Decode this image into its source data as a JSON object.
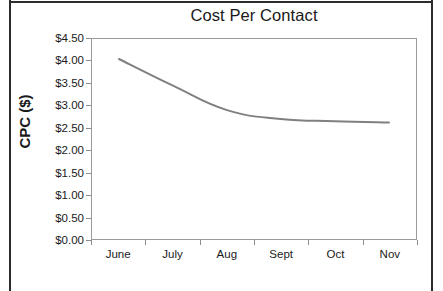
{
  "chart_data": {
    "type": "line",
    "title": "Cost Per Contact",
    "xlabel": "",
    "ylabel": "CPC ($)",
    "categories": [
      "June",
      "July",
      "Aug",
      "Sept",
      "Oct",
      "Nov"
    ],
    "series": [
      {
        "name": "CPC",
        "values": [
          4.05,
          3.45,
          2.9,
          2.7,
          2.65,
          2.62
        ]
      }
    ],
    "ylim": [
      0.0,
      4.5
    ],
    "ytick_values": [
      0.0,
      0.5,
      1.0,
      1.5,
      2.0,
      2.5,
      3.0,
      3.5,
      4.0,
      4.5
    ],
    "ytick_labels": [
      "$0.00",
      "$0.50",
      "$1.00",
      "$1.50",
      "$2.00",
      "$2.50",
      "$3.00",
      "$3.50",
      "$4.00",
      "$4.50"
    ],
    "grid": false,
    "legend": false,
    "legend_position": "none",
    "line_color": "#808080",
    "line_width": 2,
    "markers": false,
    "smooth": true,
    "axis_color": "#9a9a9a",
    "background_color": "#ffffff",
    "frame_color": "#2b2b2b"
  }
}
